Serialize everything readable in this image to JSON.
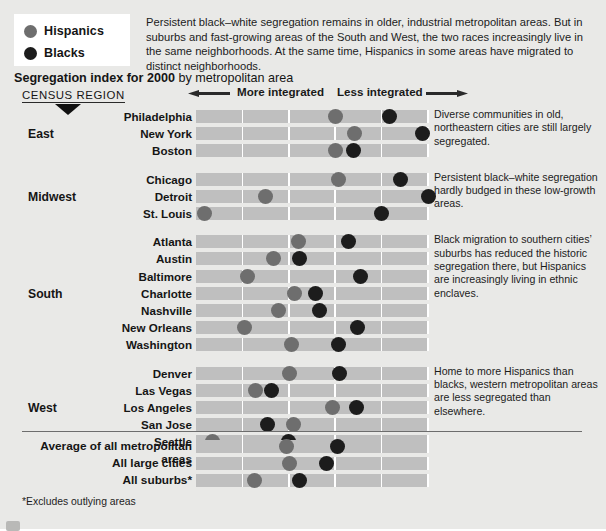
{
  "legend": {
    "items": [
      {
        "label": "Hispanics",
        "color": "#6e6e6e",
        "icon": "circle-marker-icon"
      },
      {
        "label": "Blacks",
        "color": "#1c1c1c",
        "icon": "circle-marker-icon"
      }
    ]
  },
  "intro": {
    "text": "Persistent black–white segregation remains in older, industrial metropolitan areas. But in suburbs and fast-growing areas of the South and West, the two races increasingly live in the same neighborhoods. At the same time, Hispanics in some areas have migrated to distinct neighborhoods."
  },
  "title": {
    "bold": "Segregation index for 2000",
    "rest": " by metropolitan area"
  },
  "census_region_label": "CENSUS REGION",
  "axis": {
    "left_label": "More integrated",
    "right_label": "Less integrated",
    "left_arrow_icon": "arrow-left-icon",
    "right_arrow_icon": "arrow-right-icon"
  },
  "footnote": "*Excludes outlying areas",
  "colors": {
    "hispanic": "#6e6e6e",
    "black": "#1c1c1c",
    "track": "#bfbfbf",
    "page_background": "#e9e9e7",
    "gridline": "#ffffff"
  },
  "annotations": [
    {
      "region": "East",
      "text": "Diverse communities in old, northeastern cities are still largely segregated."
    },
    {
      "region": "Midwest",
      "text": "Persistent black–white segregation hardly budged in these low-growth areas."
    },
    {
      "region": "South",
      "text": "Black migration to southern cities’ suburbs has reduced the historic segregation there, but Hispanics are increasingly living in ethnic enclaves."
    },
    {
      "region": "West",
      "text": "Home to more Hispanics than blacks, western metropolitan areas are less segregated than elsewhere."
    }
  ],
  "chart_data": {
    "type": "scatter",
    "title": "Segregation index for 2000 by metropolitan area",
    "xlabel": "Segregation index (left = more integrated, right = less integrated)",
    "ylabel": "Metropolitan area",
    "xlim": [
      0,
      5
    ],
    "grid": true,
    "gridlines_x": [
      1,
      2,
      3,
      4,
      5
    ],
    "legend_position": "top-left",
    "series": [
      {
        "name": "Hispanics",
        "color": "#6e6e6e"
      },
      {
        "name": "Blacks",
        "color": "#1c1c1c"
      }
    ],
    "regions": [
      {
        "name": "East",
        "rows": [
          {
            "label": "Philadelphia",
            "hispanic": 3.0,
            "black": 4.18
          },
          {
            "label": "New York",
            "hispanic": 3.42,
            "black": 4.88
          },
          {
            "label": "Boston",
            "hispanic": 3.0,
            "black": 3.4
          }
        ]
      },
      {
        "name": "Midwest",
        "rows": [
          {
            "label": "Chicago",
            "hispanic": 3.08,
            "black": 4.4
          },
          {
            "label": "Detroit",
            "hispanic": 1.5,
            "black": 5.02
          },
          {
            "label": "St. Louis",
            "hispanic": 0.18,
            "black": 4.0
          }
        ]
      },
      {
        "name": "South",
        "rows": [
          {
            "label": "Atlanta",
            "hispanic": 2.2,
            "black": 3.28
          },
          {
            "label": "Austin",
            "hispanic": 1.68,
            "black": 2.22
          },
          {
            "label": "Baltimore",
            "hispanic": 1.1,
            "black": 3.55
          },
          {
            "label": "Charlotte",
            "hispanic": 2.12,
            "black": 2.58
          },
          {
            "label": "Nashville",
            "hispanic": 1.78,
            "black": 2.66
          },
          {
            "label": "New Orleans",
            "hispanic": 1.05,
            "black": 3.48
          },
          {
            "label": "Washington",
            "hispanic": 2.06,
            "black": 3.08
          }
        ]
      },
      {
        "name": "West",
        "rows": [
          {
            "label": "Denver",
            "hispanic": 2.02,
            "black": 3.1
          },
          {
            "label": "Las Vegas",
            "hispanic": 1.28,
            "black": 1.62
          },
          {
            "label": "Los Angeles",
            "hispanic": 2.94,
            "black": 3.45
          },
          {
            "label": "San Jose",
            "hispanic": 2.1,
            "black": 1.55
          },
          {
            "label": "Seattle",
            "hispanic": 0.35,
            "black": 2.0
          }
        ]
      }
    ],
    "summary": [
      {
        "label": "Average of all metropolitan areas",
        "hispanic": 1.95,
        "black": 3.06
      },
      {
        "label": "All large cities",
        "hispanic": 2.02,
        "black": 2.82
      },
      {
        "label": "All suburbs*",
        "hispanic": 1.25,
        "black": 2.22
      }
    ]
  }
}
